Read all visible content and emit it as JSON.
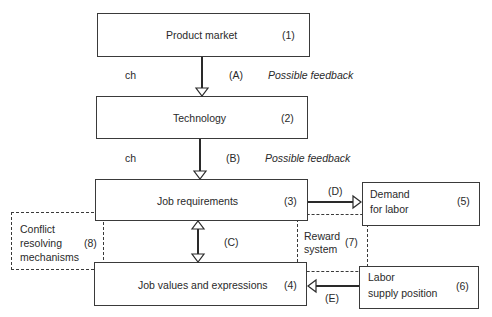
{
  "diagram": {
    "nodes": [
      {
        "id": "1",
        "label": "Product market",
        "number": "(1)"
      },
      {
        "id": "2",
        "label": "Technology",
        "number": "(2)"
      },
      {
        "id": "3",
        "label": "Job requirements",
        "number": "(3)"
      },
      {
        "id": "4",
        "label": "Job values and expressions",
        "number": "(4)"
      },
      {
        "id": "5",
        "label_line1": "Demand",
        "label_line2": "for labor",
        "number": "(5)"
      },
      {
        "id": "6",
        "label_line1": "Labor",
        "label_line2": "supply position",
        "number": "(6)"
      },
      {
        "id": "7",
        "label_line1": "Reward",
        "label_line2": "system",
        "number": "(7)",
        "style": "dashed"
      },
      {
        "id": "8",
        "label_line1": "Conflict",
        "label_line2": "resolving",
        "label_line3": "mechanisms",
        "number": "(8)",
        "style": "dashed"
      }
    ],
    "edges": [
      {
        "id": "A",
        "label": "(A)",
        "from": "1",
        "to": "2",
        "side_label": "ch",
        "note": "Possible feedback"
      },
      {
        "id": "B",
        "label": "(B)",
        "from": "2",
        "to": "3",
        "side_label": "ch",
        "note": "Possible feedback"
      },
      {
        "id": "C",
        "label": "(C)",
        "from": "3",
        "to": "4",
        "bidirectional": true
      },
      {
        "id": "D",
        "label": "(D)",
        "from": "3",
        "to": "5"
      },
      {
        "id": "E",
        "label": "(E)",
        "from": "6",
        "to": "4"
      }
    ]
  }
}
